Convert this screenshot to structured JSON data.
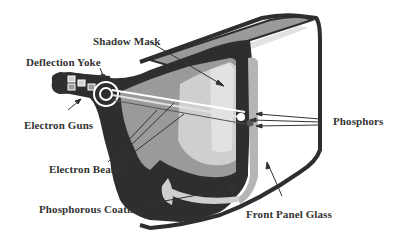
{
  "diagram": {
    "labels": {
      "shadow_mask": "Shadow Mask",
      "deflection_yoke": "Deflection Yoke",
      "electron_guns": "Electron Guns",
      "electron_beams": "Electron Beams",
      "phosphorous_coating": "Phosphorous Coating",
      "phosphors": "Phosphors",
      "front_panel_glass": "Front Panel Glass"
    },
    "colors": {
      "dark": "#2e2e2e",
      "mid_gray": "#9a9a9a",
      "light_gray": "#cfcfcf",
      "lighter_gray": "#e2e2e2",
      "label_text": "#333333",
      "background": "#ffffff"
    }
  }
}
